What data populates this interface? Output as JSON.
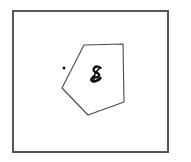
{
  "figure": {
    "title": "Hand-drawn pentagon inside a rectangular frame",
    "background_color": "#ffffff",
    "ink_color": "#4a4a4a",
    "mark_color": "#111111"
  },
  "frame": {
    "name": "outer-border-rectangle",
    "x": 13,
    "y": 11,
    "width": 155,
    "height": 141,
    "stroke_width": 1.4,
    "stroke_color": "#565656"
  },
  "pentagon": {
    "name": "pentagon-shape",
    "label": "pentagon",
    "stroke_width": 1.1,
    "stroke_color": "#4a4a4a",
    "fill_color": "#ffffff",
    "points": "84,45 123,44 124,102 88,115 62,88",
    "vertices": [
      {
        "label": "top-left-vertex",
        "x": 84,
        "y": 45
      },
      {
        "label": "top-right-vertex",
        "x": 123,
        "y": 44
      },
      {
        "label": "right-vertex",
        "x": 124,
        "y": 102
      },
      {
        "label": "bottom-vertex",
        "x": 88,
        "y": 115
      },
      {
        "label": "left-vertex",
        "x": 62,
        "y": 88
      }
    ]
  },
  "dot": {
    "name": "point-marker",
    "label": "dot",
    "x": 64,
    "y": 68,
    "radius": 1.5,
    "color": "#111111"
  },
  "glyph": {
    "name": "handwritten-s-glyph",
    "label": "S",
    "x": 96,
    "y": 77,
    "color": "#111111"
  }
}
